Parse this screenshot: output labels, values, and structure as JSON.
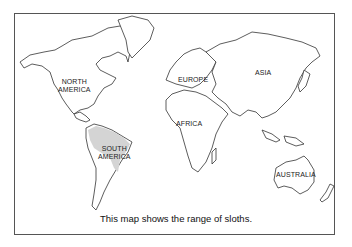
{
  "map": {
    "title": "World map",
    "caption": "This map shows the range of sloths.",
    "highlight_color": "#d4d4d4",
    "labels": {
      "north_america": [
        "NORTH",
        "AMERICA"
      ],
      "south_america": [
        "SOUTH",
        "AMERICA"
      ],
      "europe": "EUROPE",
      "asia": "ASIA",
      "africa": "AFRICA",
      "australia": "AUSTRALIA"
    },
    "highlighted_region": "South America (northern/central portion)"
  }
}
